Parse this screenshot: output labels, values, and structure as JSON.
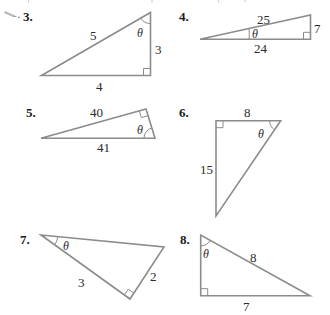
{
  "colors": {
    "line": "#8c8c8c",
    "text": "#2a2a2a",
    "number": "#1a1a1a",
    "background": "#ffffff"
  },
  "icons": {
    "pencil": "pencil-icon"
  },
  "problems": [
    {
      "number": "3.",
      "angle_label": "θ",
      "sides": {
        "hypotenuse": "5",
        "vertical": "3",
        "horizontal": "4"
      }
    },
    {
      "number": "4.",
      "angle_label": "θ",
      "sides": {
        "hypotenuse": "25",
        "vertical": "7",
        "horizontal": "24"
      }
    },
    {
      "number": "5.",
      "angle_label": "θ",
      "sides": {
        "top": "40",
        "bottom": "41"
      }
    },
    {
      "number": "6.",
      "angle_label": "θ",
      "sides": {
        "top": "8",
        "left": "15"
      }
    },
    {
      "number": "7.",
      "angle_label": "θ",
      "sides": {
        "left": "3",
        "right": "2"
      }
    },
    {
      "number": "8.",
      "angle_label": "θ",
      "sides": {
        "hypotenuse": "8",
        "bottom": "7"
      }
    }
  ]
}
